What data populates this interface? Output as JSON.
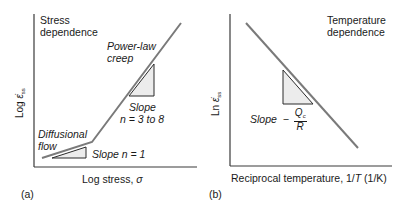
{
  "panels": [
    {
      "id": "a",
      "panel_label": "(a)",
      "title_line1": "Stress",
      "title_line2": "dependence",
      "y_axis_label_prefix": "Log",
      "y_axis_symbol": "ε̇",
      "y_axis_subscript": "ss",
      "x_axis_label_text": "Log stress, ",
      "x_axis_symbol": "σ",
      "regions": [
        {
          "name": "Diffusional flow",
          "line1": "Diffusional",
          "line2": "flow",
          "slope_label": "Slope n = 1"
        },
        {
          "name": "Power-law creep",
          "line1": "Power-law",
          "line2": "creep",
          "slope_line1": "Slope",
          "slope_line2": "n = 3 to 8"
        }
      ]
    },
    {
      "id": "b",
      "panel_label": "(b)",
      "title_line1": "Temperature",
      "title_line2": "dependence",
      "y_axis_label_prefix": "Ln",
      "y_axis_symbol": "ε̇",
      "y_axis_subscript": "ss",
      "x_axis_label_text": "Reciprocal temperature, 1/",
      "x_axis_symbol": "T",
      "x_axis_units": " (1/K)",
      "slope_label": "Slope",
      "slope_sign": "−",
      "slope_numerator": "Q",
      "slope_numerator_sub": "c",
      "slope_denominator": "R"
    }
  ],
  "colors": {
    "line": "#7a7a7a",
    "axis": "#3a3a3a",
    "triangle_fill": "#ececec",
    "triangle_stroke": "#2a2a2a",
    "text": "#1a1a1a"
  }
}
